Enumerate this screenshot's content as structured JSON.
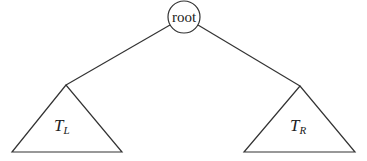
{
  "diagram": {
    "type": "binary-tree",
    "root": {
      "label": "root",
      "cx": 184,
      "cy": 17,
      "r": 16
    },
    "subtrees": [
      {
        "id": "left",
        "main": "T",
        "subscript": "L",
        "apex": [
          66,
          85
        ],
        "base_left": [
          12,
          152
        ],
        "base_right": [
          122,
          152
        ],
        "label_x": 54,
        "label_y": 131
      },
      {
        "id": "right",
        "main": "T",
        "subscript": "R",
        "apex": [
          300,
          86
        ],
        "base_left": [
          244,
          152
        ],
        "base_right": [
          355,
          152
        ],
        "label_x": 290,
        "label_y": 131
      }
    ],
    "edges": [
      {
        "from": "root",
        "to": "left",
        "x1": 170,
        "y1": 25,
        "x2": 66,
        "y2": 85
      },
      {
        "from": "root",
        "to": "right",
        "x1": 198,
        "y1": 25,
        "x2": 300,
        "y2": 86
      }
    ],
    "colors": {
      "stroke": "#333333",
      "text": "#222222",
      "background": "#ffffff"
    }
  }
}
